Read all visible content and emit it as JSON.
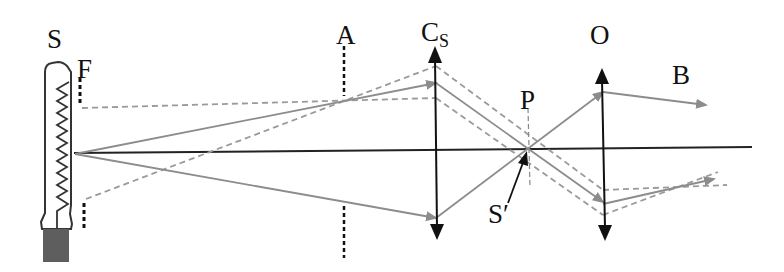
{
  "labels": {
    "source": "S",
    "filter": "F",
    "aperture": "A",
    "condenser": "C",
    "condenser_sub": "S",
    "plane": "P",
    "image": "S′",
    "objective": "O",
    "beam": "B"
  },
  "colors": {
    "axis": "#222222",
    "lens": "#111111",
    "ray": "#8c8c8c",
    "dashed_ray": "#9a9a9a",
    "bulb_outline": "#333333",
    "bulb_base": "#5e5e5e"
  },
  "geometry": {
    "optical_axis_y": 152,
    "source_x": 75,
    "aperture_x": 344,
    "condenser_x": 436,
    "plane_x": 528,
    "objective_x": 603
  }
}
